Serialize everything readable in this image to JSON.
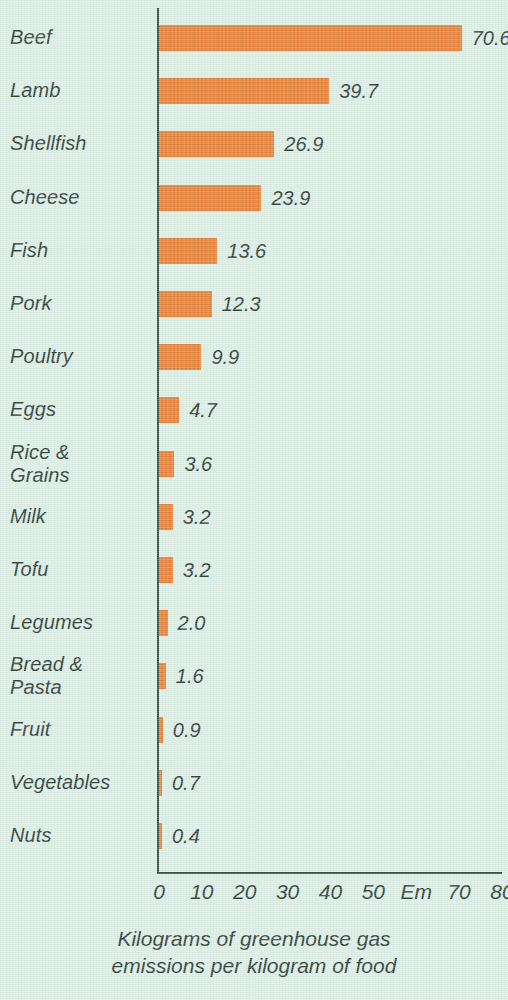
{
  "chart_data": {
    "type": "bar",
    "orientation": "horizontal",
    "title": "",
    "subtitle": "",
    "xlabel": "Kilograms of greenhouse gas\nemissions per kilogram of food",
    "ylabel": "",
    "xlim": [
      0,
      80
    ],
    "grid": false,
    "legend": null,
    "categories": [
      "Beef",
      "Lamb",
      "Shellfish",
      "Cheese",
      "Fish",
      "Pork",
      "Poultry",
      "Eggs",
      "Rice &\nGrains",
      "Milk",
      "Tofu",
      "Legumes",
      "Bread &\nPasta",
      "Fruit",
      "Vegetables",
      "Nuts"
    ],
    "values": [
      70.6,
      39.7,
      26.9,
      23.9,
      13.6,
      12.3,
      9.9,
      4.7,
      3.6,
      3.2,
      3.2,
      2.0,
      1.6,
      0.9,
      0.7,
      0.4
    ],
    "value_labels": [
      "70.6",
      "39.7",
      "26.9",
      "23.9",
      "13.6",
      "12.3",
      "9.9",
      "4.7",
      "3.6",
      "3.2",
      "3.2",
      "2.0",
      "1.6",
      "0.9",
      "0.7",
      "0.4"
    ],
    "x_tick_values": [
      0,
      10,
      20,
      30,
      40,
      50,
      60,
      70,
      80
    ],
    "x_tick_labels": [
      "0",
      "10",
      "20",
      "30",
      "40",
      "50",
      "Em",
      "70",
      "80"
    ]
  },
  "caption": {
    "text": "Kilograms of greenhouse gas\nemissions per kilogram of food"
  },
  "colors": {
    "background": "#dcede4",
    "bar": "#e8833a",
    "text": "#34433e",
    "axis": "#3f4f49"
  }
}
